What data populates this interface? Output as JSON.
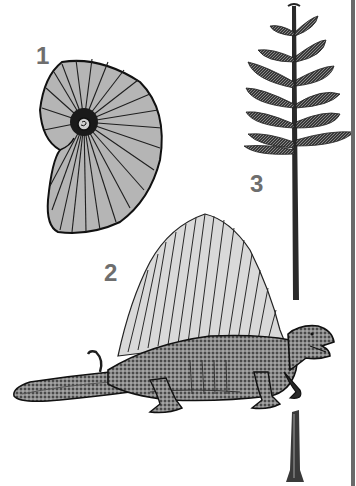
{
  "figure": {
    "labels": [
      {
        "number": "1",
        "subject": "ammonite shell"
      },
      {
        "number": "2",
        "subject": "dimetrodon"
      },
      {
        "number": "3",
        "subject": "conifer tree"
      }
    ],
    "colors": {
      "ink": "#1e1e1e",
      "label_gray": "#6e6e6e",
      "sail_fill": "#d9d9d9",
      "edge_bar": "#6a6a6a",
      "background": "#ffffff"
    }
  }
}
